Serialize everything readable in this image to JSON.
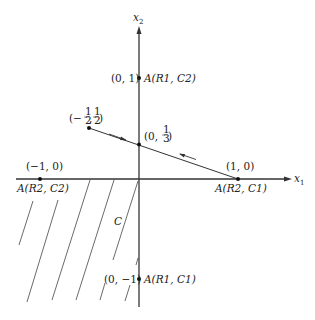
{
  "diagram": {
    "axes": {
      "x_label_main": "x",
      "x_label_sub": "1",
      "y_label_main": "x",
      "y_label_sub": "2"
    },
    "points": [
      {
        "id": "p01",
        "coord": "(0, 1)",
        "name": "A(R1, C2)"
      },
      {
        "id": "p0m1",
        "coord": "(0, −1)",
        "name": "A(R1, C1)"
      },
      {
        "id": "p10",
        "coord": "(1, 0)",
        "name": "A(R2, C1)"
      },
      {
        "id": "pm10",
        "coord": "(−1, 0)",
        "name": "A(R2, C2)"
      },
      {
        "id": "phalf",
        "coord_prefix": "(−",
        "coord_frac1": "1/2",
        "coord_frac2": "1/2",
        "coord_display": "(−½, ½)"
      },
      {
        "id": "pthird",
        "coord_display": "(0, ⅓)"
      }
    ],
    "region_label": "C",
    "frac": {
      "one": "1",
      "two": "2",
      "three": "3"
    },
    "text": {
      "p01_coord": "(0, 1)",
      "p01_name": "A(R1, C2)",
      "p0m1_coord": "(0, −1)",
      "p0m1_name": "A(R1, C1)",
      "p10_coord": "(1, 0)",
      "p10_name": "A(R2, C1)",
      "pm10_coord": "(−1, 0)",
      "pm10_name": "A(R2, C2)",
      "half_open": "(−",
      "half_comma": ",",
      "half_close": ")",
      "third_open": "(0,",
      "third_close": ")"
    }
  }
}
